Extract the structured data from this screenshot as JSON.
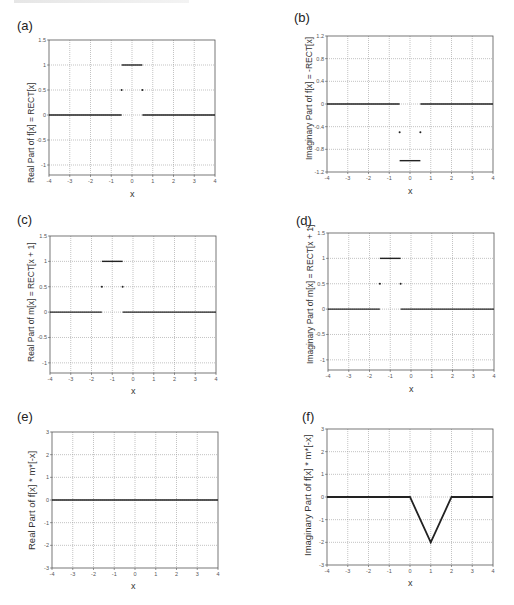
{
  "header": {
    "fragment_text": ""
  },
  "panels": [
    {
      "id": "a",
      "label": "(a)",
      "ylabel": "Real Part of f[x] = RECT[x]",
      "xlabel": "x",
      "box": {
        "left": 49,
        "top": 40,
        "right": 215,
        "bottom": 175
      },
      "ylim": [
        -1.2,
        1.5
      ],
      "yticks": [
        -1,
        -0.5,
        0,
        0.5,
        1,
        1.5
      ],
      "yticklabels": [
        "-1",
        "-0.5",
        "0",
        "0.5",
        "1",
        "1.5"
      ],
      "label_pos": {
        "left": 17,
        "top": 18
      },
      "ylabel_pos": {
        "left": 26,
        "top": 183
      },
      "xlabel_pos": {
        "left": 130,
        "top": 189
      }
    },
    {
      "id": "b",
      "label": "(b)",
      "ylabel": "Imaginary Part of f[x] = -RECT[x]",
      "xlabel": "x",
      "box": {
        "left": 327,
        "top": 36,
        "right": 493,
        "bottom": 172
      },
      "ylim": [
        -1.2,
        1.2
      ],
      "yticks": [
        -1.2,
        -0.8,
        -0.4,
        0,
        0.4,
        0.8,
        1.2
      ],
      "yticklabels": [
        "-1.2",
        "-0.8",
        "-0.4",
        "0",
        "0.4",
        "0.8",
        "1.2"
      ],
      "label_pos": {
        "left": 294,
        "top": 10
      },
      "ylabel_pos": {
        "left": 304,
        "top": 160
      },
      "xlabel_pos": {
        "left": 408,
        "top": 186
      }
    },
    {
      "id": "c",
      "label": "(c)",
      "ylabel": "Real Part of m[x] = RECT[x + 1]",
      "xlabel": "x",
      "box": {
        "left": 50,
        "top": 236,
        "right": 216,
        "bottom": 373
      },
      "ylim": [
        -1.2,
        1.5
      ],
      "yticks": [
        -1,
        -0.5,
        0,
        0.5,
        1,
        1.5
      ],
      "yticklabels": [
        "-1",
        "-0.5",
        "0",
        "0.5",
        "1",
        "1.5"
      ],
      "label_pos": {
        "left": 17,
        "top": 212
      },
      "ylabel_pos": {
        "left": 26,
        "top": 362
      },
      "xlabel_pos": {
        "left": 131,
        "top": 386
      }
    },
    {
      "id": "d",
      "label": "(d)",
      "ylabel": "Imaginary Part of m[x] = RECT[x + 1]",
      "xlabel": "x",
      "box": {
        "left": 328,
        "top": 233,
        "right": 494,
        "bottom": 370
      },
      "ylim": [
        -1.2,
        1.5
      ],
      "yticks": [
        -1,
        -0.5,
        0,
        0.5,
        1,
        1.5
      ],
      "yticklabels": [
        "-1",
        "-0.5",
        "0",
        "0.5",
        "1",
        "1.5"
      ],
      "label_pos": {
        "left": 296,
        "top": 213
      },
      "ylabel_pos": {
        "left": 305,
        "top": 364
      },
      "xlabel_pos": {
        "left": 409,
        "top": 384
      }
    },
    {
      "id": "e",
      "label": "(e)",
      "ylabel": "Real Part of f[x] * m*[-x]",
      "xlabel": "x",
      "box": {
        "left": 52,
        "top": 432,
        "right": 218,
        "bottom": 568
      },
      "ylim": [
        -3,
        3
      ],
      "yticks": [
        -3,
        -2,
        -1,
        0,
        1,
        2,
        3
      ],
      "yticklabels": [
        "-3",
        "-2",
        "-1",
        "0",
        "1",
        "2",
        "3"
      ],
      "label_pos": {
        "left": 17,
        "top": 409
      },
      "ylabel_pos": {
        "left": 26,
        "top": 550
      },
      "xlabel_pos": {
        "left": 131,
        "top": 581
      }
    },
    {
      "id": "f",
      "label": "(f)",
      "ylabel": "Imaginary Part of f[x] * m*[-x]",
      "xlabel": "x",
      "box": {
        "left": 327,
        "top": 429,
        "right": 493,
        "bottom": 565
      },
      "ylim": [
        -3,
        3
      ],
      "yticks": [
        -3,
        -2,
        -1,
        0,
        1,
        2,
        3
      ],
      "yticklabels": [
        "-3",
        "-2",
        "-1",
        "0",
        "1",
        "2",
        "3"
      ],
      "label_pos": {
        "left": 302,
        "top": 409
      },
      "ylabel_pos": {
        "left": 302,
        "top": 556
      },
      "xlabel_pos": {
        "left": 408,
        "top": 578
      }
    }
  ],
  "chart_data": [
    {
      "type": "line",
      "panel": "(a)",
      "title": "",
      "xlabel": "x",
      "ylabel": "Real Part of f[x] = RECT[x]",
      "xlim": [
        -4,
        4
      ],
      "ylim": [
        -1.2,
        1.5
      ],
      "xticks": [
        -4,
        -3,
        -2,
        -1,
        0,
        1,
        2,
        3,
        4
      ],
      "yticks": [
        -1,
        -0.5,
        0,
        0.5,
        1,
        1.5
      ],
      "grid": true,
      "segments": [
        {
          "x": [
            -4,
            -0.5
          ],
          "y": [
            0,
            0
          ]
        },
        {
          "x": [
            -0.5,
            0.5
          ],
          "y": [
            1,
            1
          ]
        },
        {
          "x": [
            0.5,
            4
          ],
          "y": [
            0,
            0
          ]
        }
      ],
      "points": [
        {
          "x": -0.5,
          "y": 0.5
        },
        {
          "x": 0.5,
          "y": 0.5
        }
      ]
    },
    {
      "type": "line",
      "panel": "(b)",
      "title": "",
      "xlabel": "x",
      "ylabel": "Imaginary Part of f[x] = -RECT[x]",
      "xlim": [
        -4,
        4
      ],
      "ylim": [
        -1.2,
        1.2
      ],
      "xticks": [
        -4,
        -3,
        -2,
        -1,
        0,
        1,
        2,
        3,
        4
      ],
      "yticks": [
        -1.2,
        -0.8,
        -0.4,
        0,
        0.4,
        0.8,
        1.2
      ],
      "grid": true,
      "segments": [
        {
          "x": [
            -4,
            -0.5
          ],
          "y": [
            0,
            0
          ]
        },
        {
          "x": [
            -0.5,
            0.5
          ],
          "y": [
            -1,
            -1
          ]
        },
        {
          "x": [
            0.5,
            4
          ],
          "y": [
            0,
            0
          ]
        }
      ],
      "points": [
        {
          "x": -0.5,
          "y": -0.5
        },
        {
          "x": 0.5,
          "y": -0.5
        }
      ]
    },
    {
      "type": "line",
      "panel": "(c)",
      "title": "",
      "xlabel": "x",
      "ylabel": "Real Part of m[x] = RECT[x + 1]",
      "xlim": [
        -4,
        4
      ],
      "ylim": [
        -1.2,
        1.5
      ],
      "xticks": [
        -4,
        -3,
        -2,
        -1,
        0,
        1,
        2,
        3,
        4
      ],
      "yticks": [
        -1,
        -0.5,
        0,
        0.5,
        1,
        1.5
      ],
      "grid": true,
      "segments": [
        {
          "x": [
            -4,
            -1.5
          ],
          "y": [
            0,
            0
          ]
        },
        {
          "x": [
            -1.5,
            -0.5
          ],
          "y": [
            1,
            1
          ]
        },
        {
          "x": [
            -0.5,
            4
          ],
          "y": [
            0,
            0
          ]
        }
      ],
      "points": [
        {
          "x": -1.5,
          "y": 0.5
        },
        {
          "x": -0.5,
          "y": 0.5
        }
      ]
    },
    {
      "type": "line",
      "panel": "(d)",
      "title": "",
      "xlabel": "x",
      "ylabel": "Imaginary Part of m[x] = RECT[x + 1]",
      "xlim": [
        -4,
        4
      ],
      "ylim": [
        -1.2,
        1.5
      ],
      "xticks": [
        -4,
        -3,
        -2,
        -1,
        0,
        1,
        2,
        3,
        4
      ],
      "yticks": [
        -1,
        -0.5,
        0,
        0.5,
        1,
        1.5
      ],
      "grid": true,
      "segments": [
        {
          "x": [
            -4,
            -1.5
          ],
          "y": [
            0,
            0
          ]
        },
        {
          "x": [
            -1.5,
            -0.5
          ],
          "y": [
            1,
            1
          ]
        },
        {
          "x": [
            -0.5,
            4
          ],
          "y": [
            0,
            0
          ]
        }
      ],
      "points": [
        {
          "x": -1.5,
          "y": 0.5
        },
        {
          "x": -0.5,
          "y": 0.5
        }
      ]
    },
    {
      "type": "line",
      "panel": "(e)",
      "title": "",
      "xlabel": "x",
      "ylabel": "Real Part of f[x] * m*[-x]",
      "xlim": [
        -4,
        4
      ],
      "ylim": [
        -3,
        3
      ],
      "xticks": [
        -4,
        -3,
        -2,
        -1,
        0,
        1,
        2,
        3,
        4
      ],
      "yticks": [
        -3,
        -2,
        -1,
        0,
        1,
        2,
        3
      ],
      "grid": true,
      "segments": [
        {
          "x": [
            -4,
            4
          ],
          "y": [
            0,
            0
          ]
        }
      ],
      "points": []
    },
    {
      "type": "line",
      "panel": "(f)",
      "title": "",
      "xlabel": "x",
      "ylabel": "Imaginary Part of f[x] * m*[-x]",
      "xlim": [
        -4,
        4
      ],
      "ylim": [
        -3,
        3
      ],
      "xticks": [
        -4,
        -3,
        -2,
        -1,
        0,
        1,
        2,
        3,
        4
      ],
      "yticks": [
        -3,
        -2,
        -1,
        0,
        1,
        2,
        3
      ],
      "grid": true,
      "segments": [
        {
          "x": [
            -4,
            0,
            1,
            2,
            4
          ],
          "y": [
            0,
            0,
            -2,
            0,
            0
          ]
        }
      ],
      "points": []
    }
  ],
  "xticks": [
    -4,
    -3,
    -2,
    -1,
    0,
    1,
    2,
    3,
    4
  ],
  "xticklabels": [
    "-4",
    "-3",
    "-2",
    "-1",
    "0",
    "1",
    "2",
    "3",
    "4"
  ]
}
